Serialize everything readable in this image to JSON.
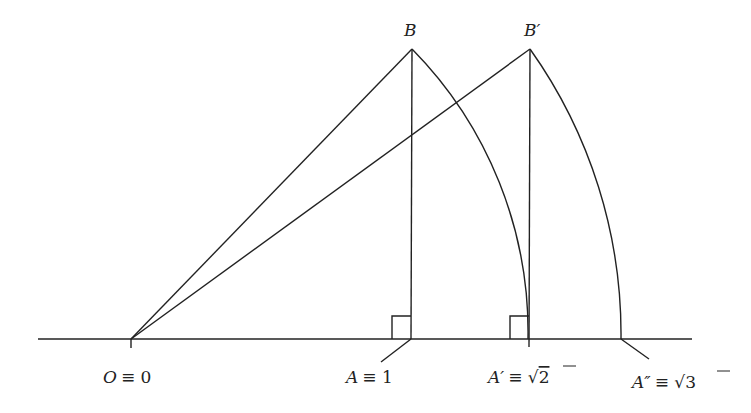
{
  "diagram": {
    "colors": {
      "stroke": "#222222",
      "background": "#ffffff"
    },
    "points": {
      "O": {
        "x": 131,
        "y": 339
      },
      "A": {
        "x": 411,
        "y": 339
      },
      "B": {
        "x": 411,
        "y": 49
      },
      "A1": {
        "x": 529,
        "y": 339
      },
      "B1": {
        "x": 529,
        "y": 49
      },
      "A2": {
        "x": 621,
        "y": 339
      }
    },
    "labels": {
      "B": "B",
      "B_prime": "B′",
      "O_left": "O",
      "O_right": "≡ 0",
      "A_left": "A",
      "A_right": "≡ 1",
      "A1_left": "A′",
      "A1_mid": "≡ √",
      "A1_val": "2",
      "A2_left": "A″",
      "A2_mid": "≡ √",
      "A2_val": "3"
    }
  }
}
